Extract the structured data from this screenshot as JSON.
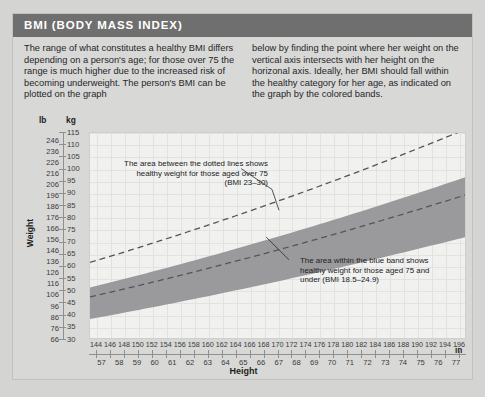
{
  "header": {
    "title": "BMI (BODY MASS INDEX)",
    "bar_color": "#6f6f6f",
    "text_color": "#ffffff"
  },
  "intro": {
    "col1": "The range of what constitutes a healthy BMI differs depending on a person's age; for those over 75 the range is much higher due to the increased risk of becoming underweight. The person's BMI can be plotted on the graph",
    "col2": "below by finding the point where her weight on the vertical axis intersects with her height on the horizonal axis. Ideally, her BMI should fall within the healthy category for her age, as indicated on the graph by the colored bands."
  },
  "chart_data": {
    "type": "area",
    "title": "BMI (BODY MASS INDEX)",
    "xlabel": "Height",
    "ylabel": "Weight",
    "grid": true,
    "legend": "none",
    "axes": {
      "y_primary": {
        "unit": "lb",
        "label": "lb",
        "ticks": [
          246,
          236,
          226,
          216,
          206,
          196,
          186,
          176,
          166,
          156,
          146,
          136,
          126,
          116,
          106,
          96,
          86,
          76,
          66
        ],
        "min": 66,
        "max": 253
      },
      "y_secondary": {
        "unit": "kg",
        "label": "kg",
        "ticks": [
          115,
          110,
          105,
          100,
          95,
          90,
          85,
          80,
          75,
          70,
          65,
          60,
          55,
          50,
          45,
          40,
          35,
          30
        ],
        "min": 30,
        "max": 115
      },
      "x_primary": {
        "unit": "cm",
        "label": "cm",
        "ticks": [
          144,
          146,
          148,
          150,
          152,
          154,
          156,
          158,
          160,
          162,
          164,
          166,
          168,
          170,
          172,
          174,
          176,
          178,
          180,
          182,
          184,
          186,
          188,
          190,
          192,
          194,
          196
        ],
        "min": 143,
        "max": 197
      },
      "x_secondary": {
        "unit": "in",
        "label": "in",
        "ticks": [
          57,
          58,
          59,
          60,
          61,
          62,
          63,
          64,
          65,
          66,
          67,
          68,
          69,
          70,
          71,
          72,
          73,
          74,
          75,
          76,
          77
        ],
        "min": 56.3,
        "max": 77.6
      }
    },
    "bands": [
      {
        "name": "healthy-75-and-under",
        "label": "blue band",
        "bmi_low": 18.5,
        "bmi_high": 24.9,
        "color": "#9a9a9c",
        "style": "filled",
        "points_kg_low": [
          38.4,
          71.1
        ],
        "points_kg_high": [
          51.6,
          95.7
        ],
        "x_cm_range": [
          144,
          196
        ]
      },
      {
        "name": "healthy-over-75",
        "label": "dotted lines",
        "bmi_low": 23,
        "bmi_high": 30,
        "color": "#54545a",
        "style": "dashed",
        "points_kg_low": [
          47.7,
          88.4
        ],
        "points_kg_high": [
          62.2,
          115.3
        ],
        "x_cm_range": [
          144,
          196
        ]
      }
    ],
    "annotations": [
      {
        "id": "annot-over75",
        "text": "The area between the dotted lines shows healthy weight for those aged over 75 (BMI 23–30)"
      },
      {
        "id": "annot-blue",
        "text": "The area within the blue band shows healthy weight for those aged 75 and under (BMI 18.5–24.9)"
      }
    ]
  }
}
